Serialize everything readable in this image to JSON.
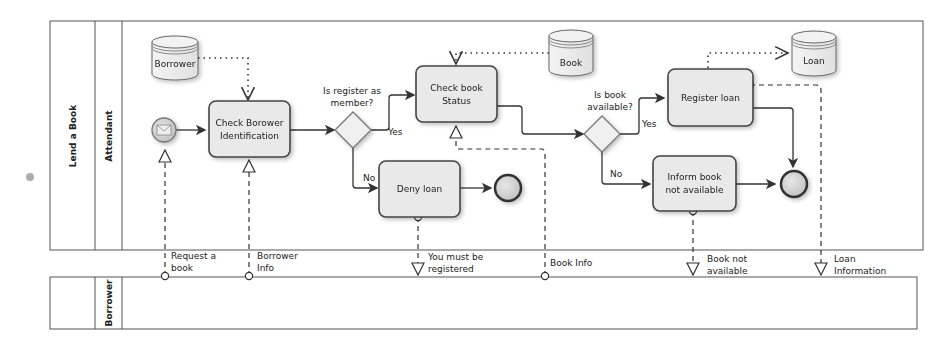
{
  "pools": {
    "main": {
      "label": "Lend a Book",
      "lane_label": "Attendant"
    },
    "borrower": {
      "label": "",
      "lane_label": "Borrower"
    }
  },
  "data_stores": {
    "borrower": "Borrower",
    "book": "Book",
    "loan": "Loan"
  },
  "tasks": {
    "check_borrower": [
      "Check Borower",
      "Identification"
    ],
    "check_book": [
      "Check book",
      "Status"
    ],
    "deny_loan": [
      "Deny loan"
    ],
    "register_loan": [
      "Register loan"
    ],
    "inform_book": [
      "Inform book",
      "not available"
    ]
  },
  "gateways": {
    "is_member": [
      "Is register as",
      "member?"
    ],
    "is_available": [
      "Is book",
      "available?"
    ]
  },
  "flow_labels": {
    "yes1": "Yes",
    "no1": "No",
    "yes2": "Yes",
    "no2": "No"
  },
  "messages": {
    "request_book": [
      "Request a",
      "book"
    ],
    "borrower_info": [
      "Borrower",
      "Info"
    ],
    "must_register": [
      "You must be",
      "registered"
    ],
    "book_info": [
      "Book Info"
    ],
    "book_not_available": [
      "Book not",
      "available"
    ],
    "loan_information": [
      "Loan",
      "Information"
    ]
  },
  "colors": {
    "stroke": "#444444",
    "task_fill": "#e8e8e8",
    "event_fill": "#d4d4d4",
    "background": "#ffffff"
  }
}
